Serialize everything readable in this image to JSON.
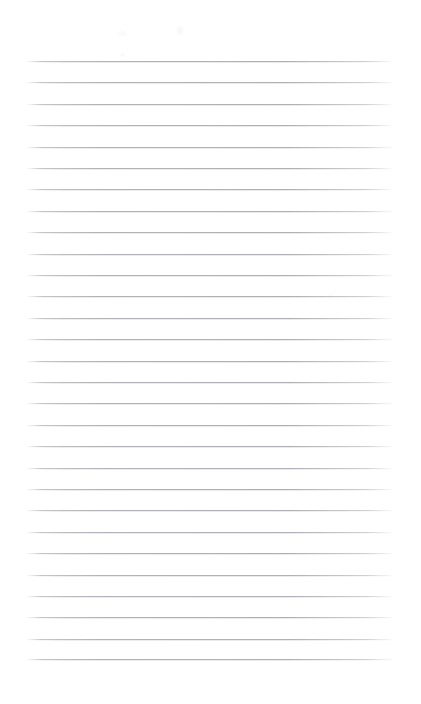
{
  "page": {
    "kind": "ruled-notebook-page",
    "title": "",
    "width": 421,
    "height": 704,
    "background_color": "#ffffff",
    "content_text": "",
    "header_text": "",
    "footer_text": "",
    "page_number": ""
  },
  "ruling": {
    "line_color": "#b2b3b8",
    "line_count": 29,
    "first_line_y": 61,
    "line_spacing": 21.4,
    "line_left_x": 27,
    "line_right_x": 392,
    "line_thickness": 1,
    "margin_rule_visible": false,
    "lines": [
      {
        "index": 1,
        "y": 61,
        "text": ""
      },
      {
        "index": 2,
        "y": 82,
        "text": ""
      },
      {
        "index": 3,
        "y": 104,
        "text": ""
      },
      {
        "index": 4,
        "y": 125,
        "text": ""
      },
      {
        "index": 5,
        "y": 147,
        "text": ""
      },
      {
        "index": 6,
        "y": 168,
        "text": ""
      },
      {
        "index": 7,
        "y": 189,
        "text": ""
      },
      {
        "index": 8,
        "y": 211,
        "text": ""
      },
      {
        "index": 9,
        "y": 232,
        "text": ""
      },
      {
        "index": 10,
        "y": 254,
        "text": ""
      },
      {
        "index": 11,
        "y": 275,
        "text": ""
      },
      {
        "index": 12,
        "y": 296,
        "text": ""
      },
      {
        "index": 13,
        "y": 318,
        "text": ""
      },
      {
        "index": 14,
        "y": 339,
        "text": ""
      },
      {
        "index": 15,
        "y": 361,
        "text": ""
      },
      {
        "index": 16,
        "y": 382,
        "text": ""
      },
      {
        "index": 17,
        "y": 403,
        "text": ""
      },
      {
        "index": 18,
        "y": 425,
        "text": ""
      },
      {
        "index": 19,
        "y": 446,
        "text": ""
      },
      {
        "index": 20,
        "y": 468,
        "text": ""
      },
      {
        "index": 21,
        "y": 489,
        "text": ""
      },
      {
        "index": 22,
        "y": 510,
        "text": ""
      },
      {
        "index": 23,
        "y": 532,
        "text": ""
      },
      {
        "index": 24,
        "y": 553,
        "text": ""
      },
      {
        "index": 25,
        "y": 575,
        "text": ""
      },
      {
        "index": 26,
        "y": 596,
        "text": ""
      },
      {
        "index": 27,
        "y": 617,
        "text": ""
      },
      {
        "index": 28,
        "y": 639,
        "text": ""
      },
      {
        "index": 29,
        "y": 659,
        "text": ""
      }
    ]
  },
  "marks": {
    "description": "faint residual pencil smudges",
    "items": [
      {
        "name": "smudge-a",
        "x": 118,
        "y": 31,
        "label": ""
      },
      {
        "name": "smudge-b",
        "x": 177,
        "y": 26,
        "label": ""
      },
      {
        "name": "smudge-c",
        "x": 120,
        "y": 53,
        "label": ""
      },
      {
        "name": "smudge-d",
        "x": 328,
        "y": 294,
        "label": ""
      }
    ]
  }
}
